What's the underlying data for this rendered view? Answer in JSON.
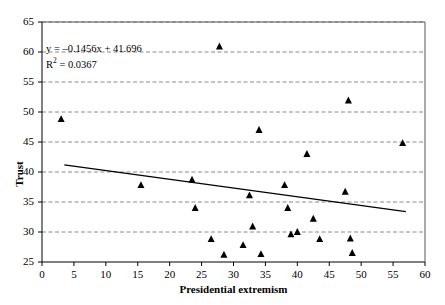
{
  "chart_data": {
    "type": "scatter",
    "title": "",
    "xlabel": "Presidential extremism",
    "ylabel": "Trust",
    "xlim": [
      0,
      60
    ],
    "ylim": [
      25,
      65
    ],
    "xticks": [
      0,
      5,
      10,
      15,
      20,
      25,
      30,
      35,
      40,
      45,
      50,
      55,
      60
    ],
    "yticks": [
      25,
      30,
      35,
      40,
      45,
      50,
      55,
      60,
      65
    ],
    "grid": "horizontal-dashed",
    "legend": "none",
    "marker": "filled-triangle",
    "marker_color": "#000000",
    "points": [
      {
        "x": 3.0,
        "y": 48.8
      },
      {
        "x": 15.5,
        "y": 37.8
      },
      {
        "x": 23.5,
        "y": 38.7
      },
      {
        "x": 24.0,
        "y": 34.0
      },
      {
        "x": 26.5,
        "y": 28.8
      },
      {
        "x": 27.8,
        "y": 60.9
      },
      {
        "x": 28.5,
        "y": 26.2
      },
      {
        "x": 31.5,
        "y": 27.8
      },
      {
        "x": 32.5,
        "y": 36.1
      },
      {
        "x": 33.0,
        "y": 30.9
      },
      {
        "x": 34.0,
        "y": 47.0
      },
      {
        "x": 34.3,
        "y": 26.3
      },
      {
        "x": 38.0,
        "y": 37.8
      },
      {
        "x": 38.5,
        "y": 34.0
      },
      {
        "x": 39.0,
        "y": 29.6
      },
      {
        "x": 40.0,
        "y": 30.0
      },
      {
        "x": 41.5,
        "y": 43.0
      },
      {
        "x": 42.5,
        "y": 32.2
      },
      {
        "x": 43.5,
        "y": 28.8
      },
      {
        "x": 47.5,
        "y": 36.7
      },
      {
        "x": 48.0,
        "y": 51.9
      },
      {
        "x": 48.3,
        "y": 28.9
      },
      {
        "x": 48.6,
        "y": 26.5
      },
      {
        "x": 56.5,
        "y": 44.8
      }
    ],
    "trendline": {
      "slope": -0.1456,
      "intercept": 41.696,
      "x_start": 3.5,
      "x_end": 57.0,
      "color": "#000000"
    },
    "annotation": {
      "equation": "y = –0.1456x + 41.696",
      "r_squared_prefix": "R",
      "r_squared_exponent": "2",
      "r_squared_value": " = 0.0367"
    }
  }
}
